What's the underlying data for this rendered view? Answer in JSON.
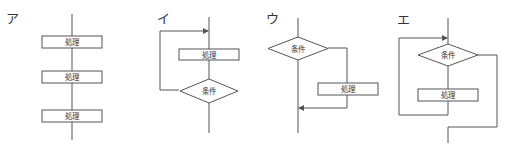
{
  "diagrams": [
    {
      "id": "a",
      "label": "ア",
      "structure": "sequence",
      "nodes": [
        {
          "type": "process",
          "text": "処理"
        },
        {
          "type": "process",
          "text": "処理"
        },
        {
          "type": "process",
          "text": "処理"
        }
      ]
    },
    {
      "id": "i",
      "label": "イ",
      "structure": "post-test loop",
      "nodes": [
        {
          "type": "process",
          "text": "処理"
        },
        {
          "type": "decision",
          "text": "条件"
        }
      ]
    },
    {
      "id": "u",
      "label": "ウ",
      "structure": "selection",
      "nodes": [
        {
          "type": "decision",
          "text": "条件"
        },
        {
          "type": "process",
          "text": "処理"
        }
      ]
    },
    {
      "id": "e",
      "label": "エ",
      "structure": "pre-test loop",
      "nodes": [
        {
          "type": "decision",
          "text": "条件"
        },
        {
          "type": "process",
          "text": "処理"
        }
      ]
    }
  ],
  "colors": {
    "line": "#555555",
    "text": "#333333",
    "background": "#ffffff"
  }
}
